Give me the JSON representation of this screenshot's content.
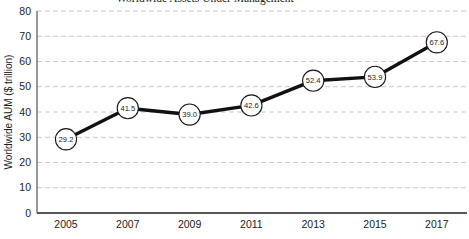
{
  "chart_data": {
    "type": "line",
    "title": "Worldwide Assets Under Management",
    "title_note": "title clipped at top edge of screenshot; only bottoms of glyphs visible",
    "ylabel": "Worldwide AUM ($ trillion)",
    "xlabel": "",
    "categories": [
      "2005",
      "2007",
      "2009",
      "2011",
      "2013",
      "2015",
      "2017"
    ],
    "values": [
      29.2,
      41.5,
      39.0,
      42.6,
      52.4,
      53.9,
      67.6
    ],
    "point_labels": [
      "29.2",
      "41.5",
      "39.0",
      "42.6",
      "52.4",
      "53.9",
      "67.6"
    ],
    "ylim": [
      0,
      80
    ],
    "ytick_step": 10,
    "ytick_labels": [
      "0",
      "10",
      "20",
      "30",
      "40",
      "50",
      "60",
      "70",
      "80"
    ],
    "grid": "horizontal dashed",
    "legend": "none",
    "colors": {
      "line": "#111111",
      "marker_fill": "#ffffff",
      "marker_stroke": "#1a1a1a",
      "grid": "#c9c9c9",
      "axis": "#555555",
      "text": "#222222"
    }
  }
}
